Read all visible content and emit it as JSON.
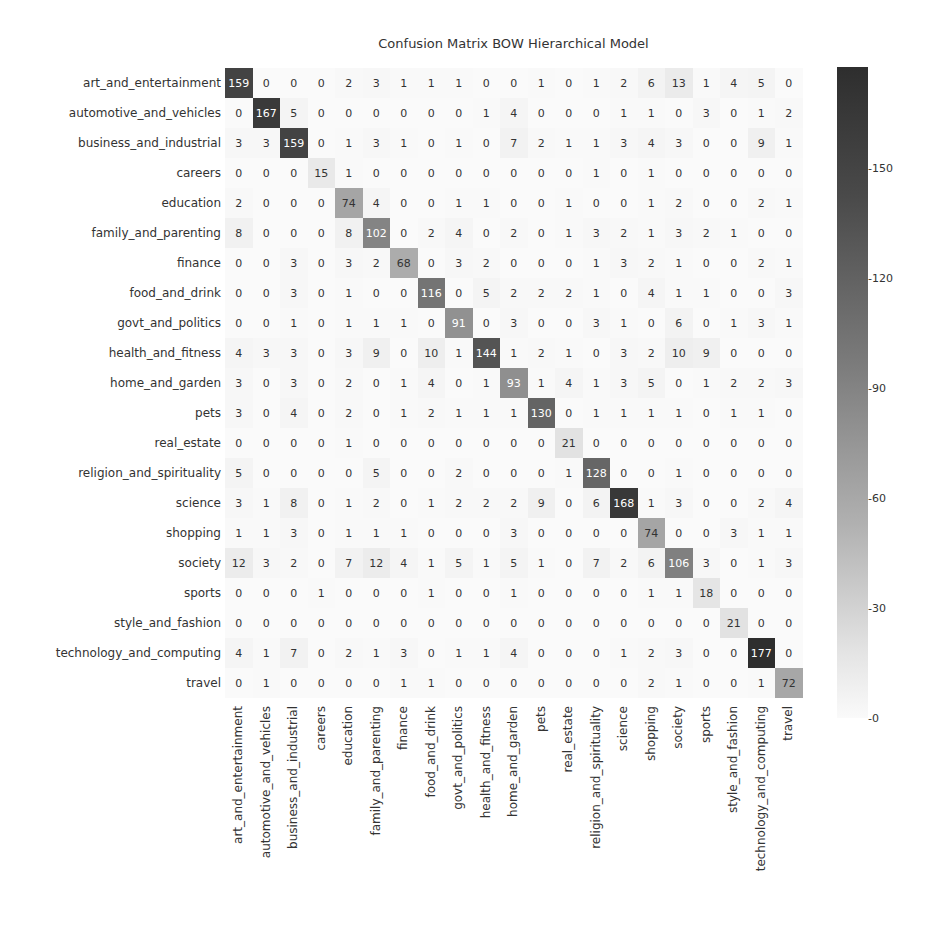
{
  "chart_data": {
    "type": "heatmap",
    "title": "Confusion Matrix BOW Hierarchical Model",
    "xlabel": "",
    "ylabel": "",
    "labels": [
      "art_and_entertainment",
      "automotive_and_vehicles",
      "business_and_industrial",
      "careers",
      "education",
      "family_and_parenting",
      "finance",
      "food_and_drink",
      "govt_and_politics",
      "health_and_fitness",
      "home_and_garden",
      "pets",
      "real_estate",
      "religion_and_spirituality",
      "science",
      "shopping",
      "society",
      "sports",
      "style_and_fashion",
      "technology_and_computing",
      "travel"
    ],
    "matrix": [
      [
        159,
        0,
        0,
        0,
        2,
        3,
        1,
        1,
        1,
        0,
        0,
        1,
        0,
        1,
        2,
        6,
        13,
        1,
        4,
        5,
        0
      ],
      [
        0,
        167,
        5,
        0,
        0,
        0,
        0,
        0,
        0,
        1,
        4,
        0,
        0,
        0,
        1,
        1,
        0,
        3,
        0,
        1,
        2
      ],
      [
        3,
        3,
        159,
        0,
        1,
        3,
        1,
        0,
        1,
        0,
        7,
        2,
        1,
        1,
        3,
        4,
        3,
        0,
        0,
        9,
        1
      ],
      [
        0,
        0,
        0,
        15,
        1,
        0,
        0,
        0,
        0,
        0,
        0,
        0,
        0,
        1,
        0,
        1,
        0,
        0,
        0,
        0,
        0
      ],
      [
        2,
        0,
        0,
        0,
        74,
        4,
        0,
        0,
        1,
        1,
        0,
        0,
        1,
        0,
        0,
        1,
        2,
        0,
        0,
        2,
        1
      ],
      [
        8,
        0,
        0,
        0,
        8,
        102,
        0,
        2,
        4,
        0,
        2,
        0,
        1,
        3,
        2,
        1,
        3,
        2,
        1,
        0,
        0
      ],
      [
        0,
        0,
        3,
        0,
        3,
        2,
        68,
        0,
        3,
        2,
        0,
        0,
        0,
        1,
        3,
        2,
        1,
        0,
        0,
        2,
        1
      ],
      [
        0,
        0,
        3,
        0,
        1,
        0,
        0,
        116,
        0,
        5,
        2,
        2,
        2,
        1,
        0,
        4,
        1,
        1,
        0,
        0,
        3
      ],
      [
        0,
        0,
        1,
        0,
        1,
        1,
        1,
        0,
        91,
        0,
        3,
        0,
        0,
        3,
        1,
        0,
        6,
        0,
        1,
        3,
        1
      ],
      [
        4,
        3,
        3,
        0,
        3,
        9,
        0,
        10,
        1,
        144,
        1,
        2,
        1,
        0,
        3,
        2,
        10,
        9,
        0,
        0,
        0
      ],
      [
        3,
        0,
        3,
        0,
        2,
        0,
        1,
        4,
        0,
        1,
        93,
        1,
        4,
        1,
        3,
        5,
        0,
        1,
        2,
        2,
        3
      ],
      [
        3,
        0,
        4,
        0,
        2,
        0,
        1,
        2,
        1,
        1,
        1,
        130,
        0,
        1,
        1,
        1,
        1,
        0,
        1,
        1,
        0
      ],
      [
        0,
        0,
        0,
        0,
        1,
        0,
        0,
        0,
        0,
        0,
        0,
        0,
        21,
        0,
        0,
        0,
        0,
        0,
        0,
        0,
        0
      ],
      [
        5,
        0,
        0,
        0,
        0,
        5,
        0,
        0,
        2,
        0,
        0,
        0,
        1,
        128,
        0,
        0,
        1,
        0,
        0,
        0,
        0
      ],
      [
        3,
        1,
        8,
        0,
        1,
        2,
        0,
        1,
        2,
        2,
        2,
        9,
        0,
        6,
        168,
        1,
        3,
        0,
        0,
        2,
        4
      ],
      [
        1,
        1,
        3,
        0,
        1,
        1,
        1,
        0,
        0,
        0,
        3,
        0,
        0,
        0,
        0,
        74,
        0,
        0,
        3,
        1,
        1
      ],
      [
        12,
        3,
        2,
        0,
        7,
        12,
        4,
        1,
        5,
        1,
        5,
        1,
        0,
        7,
        2,
        6,
        106,
        3,
        0,
        1,
        3
      ],
      [
        0,
        0,
        0,
        1,
        0,
        0,
        0,
        1,
        0,
        0,
        1,
        0,
        0,
        0,
        0,
        1,
        1,
        18,
        0,
        0,
        0
      ],
      [
        0,
        0,
        0,
        0,
        0,
        0,
        0,
        0,
        0,
        0,
        0,
        0,
        0,
        0,
        0,
        0,
        0,
        0,
        21,
        0,
        0
      ],
      [
        4,
        1,
        7,
        0,
        2,
        1,
        3,
        0,
        1,
        1,
        4,
        0,
        0,
        0,
        1,
        2,
        3,
        0,
        0,
        177,
        0
      ],
      [
        0,
        1,
        0,
        0,
        0,
        0,
        1,
        1,
        0,
        0,
        0,
        0,
        0,
        0,
        0,
        2,
        1,
        0,
        0,
        1,
        72
      ]
    ],
    "colorbar": {
      "ticks": [
        0,
        30,
        60,
        90,
        120,
        150
      ],
      "range": [
        0,
        177
      ],
      "colormap": "greys"
    },
    "grid": false,
    "legend_position": "right"
  }
}
